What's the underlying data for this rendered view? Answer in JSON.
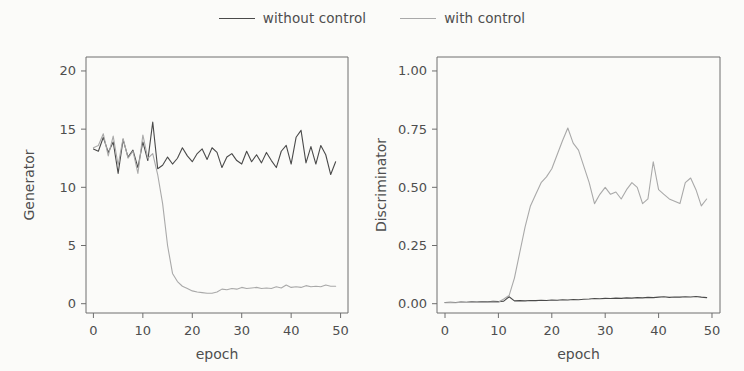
{
  "figure": {
    "background_color": "#fbfbf9",
    "axis_color": "#6e6e6e",
    "text_color": "#4e4e4e"
  },
  "legend": {
    "position": "top-center",
    "entries": [
      {
        "label": "without control",
        "color": "#4a4a4a",
        "swatch_name": "legend-line-without-control"
      },
      {
        "label": "with control",
        "color": "#a9a9a9",
        "swatch_name": "legend-line-with-control"
      }
    ]
  },
  "chart_data": [
    {
      "id": "generator",
      "type": "line",
      "title": "",
      "xlabel": "epoch",
      "ylabel": "Generator",
      "xlim": [
        -1.5,
        51.5
      ],
      "ylim": [
        -0.8,
        21.2
      ],
      "xticks": [
        0,
        10,
        20,
        30,
        40,
        50
      ],
      "xticklabels": [
        "0",
        "10",
        "20",
        "30",
        "40",
        "50"
      ],
      "yticks": [
        0,
        5,
        10,
        15,
        20
      ],
      "yticklabels": [
        "0",
        "5",
        "10",
        "15",
        "20"
      ],
      "grid": false,
      "legend_position": "figure top-center",
      "x": [
        0,
        1,
        2,
        3,
        4,
        5,
        6,
        7,
        8,
        9,
        10,
        11,
        12,
        13,
        14,
        15,
        16,
        17,
        18,
        19,
        20,
        21,
        22,
        23,
        24,
        25,
        26,
        27,
        28,
        29,
        30,
        31,
        32,
        33,
        34,
        35,
        36,
        37,
        38,
        39,
        40,
        41,
        42,
        43,
        44,
        45,
        46,
        47,
        48,
        49
      ],
      "series": [
        {
          "name": "without control",
          "color": "#4a4a4a",
          "values": [
            13.3,
            13.1,
            14.3,
            13.0,
            13.9,
            11.2,
            14.1,
            12.6,
            13.2,
            11.7,
            13.9,
            12.3,
            15.6,
            11.6,
            11.9,
            12.6,
            12.0,
            12.5,
            13.4,
            12.7,
            12.2,
            12.9,
            13.3,
            12.4,
            13.4,
            13.0,
            11.7,
            12.6,
            12.9,
            12.3,
            12.0,
            13.1,
            12.2,
            12.8,
            12.1,
            13.0,
            12.3,
            11.7,
            13.1,
            13.6,
            12.0,
            14.3,
            14.9,
            12.1,
            13.5,
            12.0,
            13.6,
            12.8,
            11.1,
            12.2
          ]
        },
        {
          "name": "with control",
          "color": "#a9a9a9",
          "values": [
            13.4,
            13.6,
            14.6,
            12.7,
            14.4,
            11.9,
            14.2,
            12.5,
            13.1,
            11.2,
            14.5,
            12.5,
            12.9,
            11.1,
            8.6,
            5.0,
            2.6,
            1.9,
            1.5,
            1.3,
            1.1,
            1.0,
            0.95,
            0.9,
            0.9,
            1.0,
            1.25,
            1.2,
            1.3,
            1.25,
            1.4,
            1.3,
            1.35,
            1.4,
            1.3,
            1.35,
            1.3,
            1.45,
            1.35,
            1.6,
            1.4,
            1.45,
            1.4,
            1.55,
            1.45,
            1.5,
            1.45,
            1.6,
            1.5,
            1.5
          ]
        }
      ]
    },
    {
      "id": "discriminator",
      "type": "line",
      "title": "",
      "xlabel": "epoch",
      "ylabel": "Discriminator",
      "xlim": [
        -1.5,
        51.5
      ],
      "ylim": [
        -0.04,
        1.06
      ],
      "xticks": [
        0,
        10,
        20,
        30,
        40,
        50
      ],
      "xticklabels": [
        "0",
        "10",
        "20",
        "30",
        "40",
        "50"
      ],
      "yticks": [
        0.0,
        0.25,
        0.5,
        0.75,
        1.0
      ],
      "yticklabels": [
        "0.00",
        "0.25",
        "0.50",
        "0.75",
        "1.00"
      ],
      "grid": false,
      "legend_position": "figure top-center",
      "x": [
        0,
        1,
        2,
        3,
        4,
        5,
        6,
        7,
        8,
        9,
        10,
        11,
        12,
        13,
        14,
        15,
        16,
        17,
        18,
        19,
        20,
        21,
        22,
        23,
        24,
        25,
        26,
        27,
        28,
        29,
        30,
        31,
        32,
        33,
        34,
        35,
        36,
        37,
        38,
        39,
        40,
        41,
        42,
        43,
        44,
        45,
        46,
        47,
        48,
        49
      ],
      "series": [
        {
          "name": "without control",
          "color": "#4a4a4a",
          "values": [
            0.005,
            0.006,
            0.005,
            0.007,
            0.006,
            0.008,
            0.007,
            0.009,
            0.008,
            0.01,
            0.009,
            0.011,
            0.03,
            0.012,
            0.013,
            0.012,
            0.014,
            0.013,
            0.015,
            0.014,
            0.016,
            0.015,
            0.017,
            0.016,
            0.018,
            0.017,
            0.019,
            0.02,
            0.022,
            0.021,
            0.023,
            0.022,
            0.024,
            0.023,
            0.025,
            0.024,
            0.026,
            0.025,
            0.027,
            0.026,
            0.028,
            0.03,
            0.027,
            0.029,
            0.028,
            0.03,
            0.029,
            0.031,
            0.028,
            0.026
          ]
        },
        {
          "name": "with control",
          "color": "#a9a9a9",
          "values": [
            0.004,
            0.005,
            0.004,
            0.006,
            0.005,
            0.006,
            0.005,
            0.007,
            0.006,
            0.007,
            0.006,
            0.02,
            0.035,
            0.11,
            0.22,
            0.33,
            0.42,
            0.47,
            0.52,
            0.545,
            0.58,
            0.64,
            0.7,
            0.755,
            0.69,
            0.66,
            0.59,
            0.52,
            0.43,
            0.47,
            0.5,
            0.47,
            0.48,
            0.45,
            0.49,
            0.52,
            0.5,
            0.43,
            0.45,
            0.61,
            0.49,
            0.47,
            0.45,
            0.44,
            0.43,
            0.52,
            0.54,
            0.49,
            0.42,
            0.45
          ]
        }
      ]
    }
  ]
}
